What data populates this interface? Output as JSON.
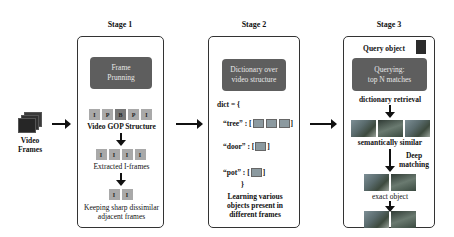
{
  "input": {
    "label_line1": "Video",
    "label_line2": "Frames"
  },
  "stage1": {
    "title": "Stage 1",
    "header_line1": "Frame",
    "header_line2": "Prunning",
    "gop_frames": [
      "I",
      "P",
      "B",
      "P",
      "I"
    ],
    "gop_label": "Video GOP Structure",
    "iframes": [
      "I",
      "I",
      "I",
      "I"
    ],
    "iframes_label": "Extracted I-frames",
    "kept_frames": [
      "I",
      "I"
    ],
    "kept_label_line1": "Keeping sharp dissimilar",
    "kept_label_line2": "adjacent frames"
  },
  "stage2": {
    "title": "Stage 2",
    "header_line1": "Dictionary over",
    "header_line2": "video structure",
    "dict_open": "dict = {",
    "entries": [
      {
        "key": "“tree” : [",
        "count": 3,
        "close": "]"
      },
      {
        "key": "“door” : [",
        "count": 1,
        "close": "]"
      },
      {
        "key": "“pot” :  [",
        "count": 1,
        "close": "]"
      }
    ],
    "dict_close": "}",
    "caption_line1": "Learning various",
    "caption_line2": "objects present in",
    "caption_line3": "different frames"
  },
  "stage3": {
    "title": "Stage 3",
    "query_label": "Query object",
    "header_line1": "Querying:",
    "header_line2": "top N matches",
    "retrieval_label": "dictionary retrieval",
    "similar_label": "semantically similar",
    "deep_line1": "Deep",
    "deep_line2": "matching",
    "exact_label": "exact object"
  }
}
